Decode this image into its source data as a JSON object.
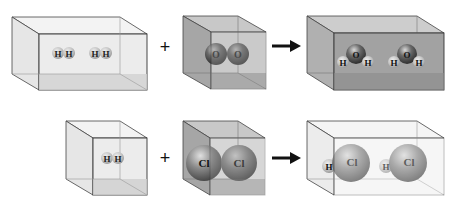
{
  "diagram": {
    "title": "",
    "reactions": [
      {
        "name": "water-formation",
        "operator": "+",
        "arrow": "→",
        "reactants": [
          {
            "name": "hydrogen",
            "box": "wide",
            "shade": "light",
            "molecules": [
              [
                "H",
                "H"
              ],
              [
                "H",
                "H"
              ]
            ]
          },
          {
            "name": "oxygen",
            "box": "cube",
            "shade": "dark",
            "molecules": [
              [
                "O",
                "O"
              ]
            ]
          }
        ],
        "products": [
          {
            "name": "water",
            "box": "wide",
            "shade": "dark",
            "molecules": [
              {
                "center": "O",
                "subs": [
                  "H",
                  "H"
                ]
              },
              {
                "center": "O",
                "subs": [
                  "H",
                  "H"
                ]
              }
            ]
          }
        ]
      },
      {
        "name": "hydrogen-chloride-formation",
        "operator": "+",
        "arrow": "→",
        "reactants": [
          {
            "name": "hydrogen",
            "box": "cube",
            "shade": "light",
            "molecules": [
              [
                "H",
                "H"
              ]
            ]
          },
          {
            "name": "chlorine",
            "box": "cube",
            "shade": "dark",
            "molecules": [
              [
                "Cl",
                "Cl"
              ]
            ]
          }
        ],
        "products": [
          {
            "name": "hydrogen-chloride",
            "box": "wide",
            "shade": "light",
            "molecules": [
              [
                "H",
                "Cl"
              ],
              [
                "H",
                "Cl"
              ]
            ]
          }
        ]
      }
    ],
    "labels": {
      "plus": "+",
      "H": "H",
      "O": "O",
      "Cl": "Cl"
    },
    "colors": {
      "light_box_fill": "#ebebeb",
      "dark_box_fill": "#a9a9a9",
      "edge": "#333333",
      "atom_H": "#cfcfcf",
      "atom_O": "#6e6e6e",
      "atom_Cl": "#8a8a8a"
    }
  }
}
